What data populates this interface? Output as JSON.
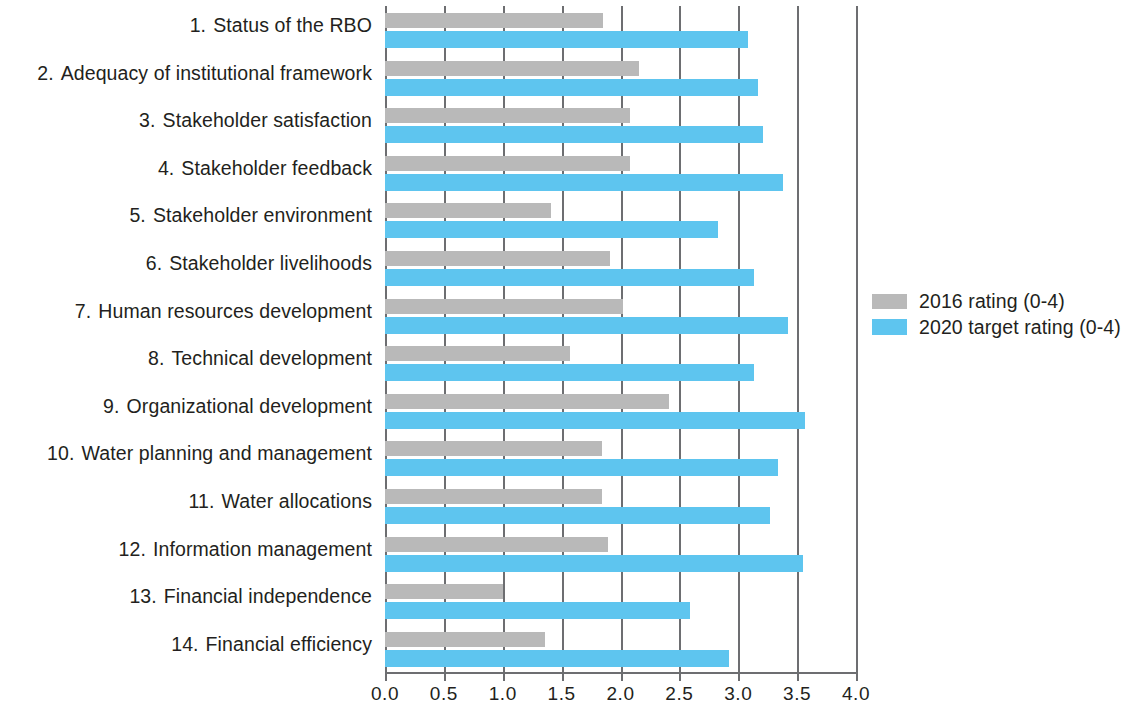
{
  "chart_data": {
    "type": "bar",
    "orientation": "horizontal",
    "title": "",
    "xlabel": "",
    "ylabel": "",
    "xlim": [
      0,
      4
    ],
    "xticks": [
      "0.0",
      "0.5",
      "1.0",
      "1.5",
      "2.0",
      "2.5",
      "3.0",
      "3.5",
      "4.0"
    ],
    "grid": true,
    "legend_position": "right",
    "categories": [
      "Status of the RBO",
      "Adequacy of institutional framework",
      "Stakeholder satisfaction",
      "Stakeholder feedback",
      "Stakeholder environment",
      "Stakeholder livelihoods",
      "Human resources development",
      "Technical development",
      "Organizational development",
      "Water planning and management",
      "Water allocations",
      "Information management",
      "Financial independence",
      "Financial efficiency"
    ],
    "category_numbers": [
      "1.",
      "2.",
      "3.",
      "4.",
      "5.",
      "6.",
      "7.",
      "8.",
      "9.",
      "10.",
      "11.",
      "12.",
      "13.",
      "14."
    ],
    "series": [
      {
        "name": "2016 rating (0-4)",
        "color": "#b9b9b9",
        "values": [
          1.85,
          2.16,
          2.08,
          2.08,
          1.41,
          1.91,
          2.02,
          1.57,
          2.41,
          1.84,
          1.84,
          1.89,
          1.0,
          1.36
        ]
      },
      {
        "name": "2020 target rating (0-4)",
        "color": "#5ec5ef",
        "values": [
          3.08,
          3.17,
          3.21,
          3.38,
          2.83,
          3.13,
          3.42,
          3.13,
          3.57,
          3.34,
          3.27,
          3.55,
          2.59,
          2.92
        ]
      }
    ]
  },
  "legend": {
    "items": [
      {
        "label": "2016 rating (0-4)",
        "swatch": "sw-2016"
      },
      {
        "label": "2020 target rating (0-4)",
        "swatch": "sw-2020"
      }
    ]
  },
  "colors": {
    "series_2016": "#b9b9b9",
    "series_2020": "#5ec5ef",
    "axis": "#6d6e71",
    "text": "#231f20",
    "background": "#ffffff"
  }
}
